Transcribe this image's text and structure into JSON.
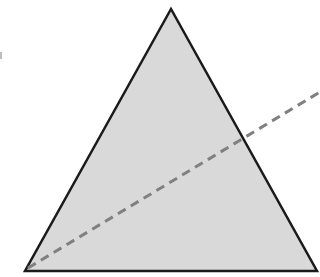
{
  "diagram": {
    "type": "geometry",
    "shapes": [
      {
        "kind": "triangle",
        "points": [
          [
            171,
            9
          ],
          [
            25,
            271
          ],
          [
            317,
            271
          ]
        ],
        "fill": "#d9d9d9",
        "stroke": "#1a1a1a"
      },
      {
        "kind": "dashed-line",
        "from": [
          28,
          268
        ],
        "to": [
          320,
          92
        ],
        "stroke": "#808080"
      }
    ]
  },
  "colors": {
    "background": "#ffffff",
    "triangle_fill": "#d9d9d9",
    "triangle_stroke": "#1a1a1a",
    "dashed_line": "#808080"
  }
}
